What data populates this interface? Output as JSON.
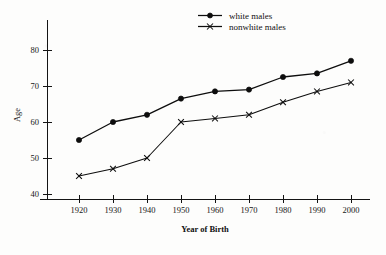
{
  "chart_data": {
    "type": "line",
    "title": "",
    "xlabel": "Year of Birth",
    "ylabel": "Age",
    "x": [
      1920,
      1930,
      1940,
      1950,
      1960,
      1970,
      1980,
      1990,
      2000
    ],
    "xticklabels": [
      "1920",
      "1930",
      "1940",
      "1950",
      "1960",
      "1970",
      "1980",
      "1990",
      "2000"
    ],
    "yticks": [
      40,
      50,
      60,
      70,
      80
    ],
    "yticklabels": [
      "40",
      "50",
      "60",
      "70",
      "80"
    ],
    "xlim": [
      1915,
      2005
    ],
    "ylim": [
      36,
      84
    ],
    "grid": false,
    "legend_position": "top-right-inside",
    "series": [
      {
        "name": "white males",
        "marker": "filled-circle",
        "linestyle": "solid",
        "values": [
          55,
          60,
          62,
          66.5,
          68.5,
          69,
          72.5,
          73.5,
          77
        ]
      },
      {
        "name": "nonwhite males",
        "marker": "cross",
        "linestyle": "solid-thin",
        "values": [
          45,
          47,
          50,
          60,
          61,
          62,
          65.5,
          68.5,
          71
        ]
      }
    ]
  },
  "legend": {
    "items": [
      {
        "label": "white males",
        "marker": "filled-circle"
      },
      {
        "label": "nonwhite males",
        "marker": "cross"
      }
    ]
  },
  "axes": {
    "y_title": "Age",
    "x_title": "Year of Birth"
  },
  "colors": {
    "ink": "#0d0d0d",
    "paper": "#fdfdfc"
  }
}
